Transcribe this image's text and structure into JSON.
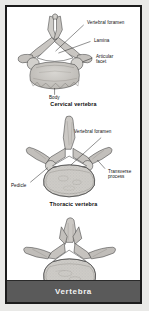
{
  "figure": {
    "footer_title": "Vertebra",
    "panels": [
      {
        "id": "cervical",
        "caption": "Cervical vertebra",
        "labels": [
          {
            "text": "Vertebral foramen"
          },
          {
            "text": "Lamina"
          },
          {
            "text": "Articular facet"
          },
          {
            "text": "Body"
          }
        ]
      },
      {
        "id": "thoracic",
        "caption": "Thoracic vertebra",
        "labels": [
          {
            "text": "Vertebral foramen"
          },
          {
            "text": "Transverse process"
          },
          {
            "text": "Pedicle"
          }
        ]
      },
      {
        "id": "lumbar",
        "caption": "Limbar vertebra",
        "labels": []
      }
    ]
  },
  "colors": {
    "frame_border": "#1c1c1c",
    "page_background": "#e9e9e7",
    "panel_background": "#ffffff",
    "footer_background": "#5a5a5a",
    "footer_text": "#f2f2f2",
    "bone_fill": "#cfcdc9",
    "bone_stroke": "#3a3a3a",
    "bone_shade": "#b4b1ac"
  }
}
